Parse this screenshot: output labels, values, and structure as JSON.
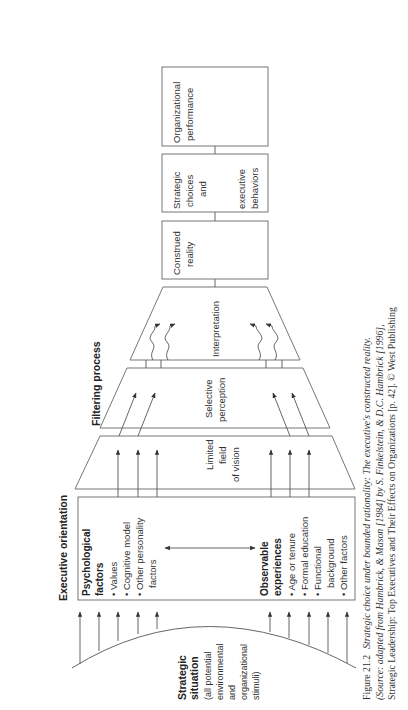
{
  "orientation": "rotated-90-ccw",
  "strategic_situation": {
    "title_lines": [
      "Strategic",
      "situation"
    ],
    "desc_lines": [
      "(all potential",
      "environmental",
      "and",
      "organizational",
      "stimuli)"
    ]
  },
  "executive_orientation": {
    "label": "Executive orientation",
    "psychological": {
      "title_lines": [
        "Psychological",
        "factors"
      ],
      "items": [
        "• Values",
        "• Cognitive model",
        "• Other personality",
        "   factors"
      ]
    },
    "observable": {
      "title_lines": [
        "Observable",
        "experiences"
      ],
      "items": [
        "• Age or tenure",
        "• Formal education",
        "• Functional",
        "   background",
        "• Other factors"
      ]
    }
  },
  "filtering_process": {
    "label": "Filtering process",
    "stages": [
      {
        "name": "limited-field",
        "lines": [
          "Limited",
          "field",
          "of vision"
        ]
      },
      {
        "name": "selective-perception",
        "lines": [
          "Selective",
          "perception"
        ]
      },
      {
        "name": "interpretation",
        "lines": [
          "Interpretation"
        ]
      }
    ]
  },
  "outcomes": [
    {
      "name": "construed-reality",
      "lines": [
        "Construed",
        "reality"
      ]
    },
    {
      "name": "strategic-choices",
      "lines": [
        "Strategic",
        "choices",
        "and",
        "",
        "executive",
        "behaviors"
      ]
    },
    {
      "name": "organizational-performance",
      "lines": [
        "Organizational",
        "performance"
      ]
    }
  ],
  "caption": {
    "line1_prefix": "Figure 21.2",
    "line1_text": "Strategic choice under bounded rationality: The executive's constructed reality.",
    "line2": "(Source: adapted from Hambrick, & Mason [1984] by S. Finkelstein, & D.C. Hambrick [1996],",
    "line3": "Strategic Leadership: Top Executives and Their Effects on Organizations [p. 42]. © West Publishing"
  }
}
